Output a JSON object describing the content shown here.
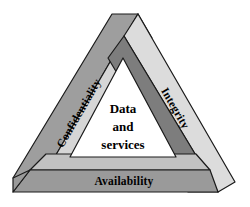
{
  "figure": {
    "name": "cia-triad-impossible-triangle",
    "background_color": "#ffffff",
    "outline_color": "#1a1a1a"
  },
  "beams": [
    {
      "id": "confidentiality",
      "label": "Confidentiality",
      "position": "left",
      "face_color": "#9e9e9e",
      "edge_color": "#d6d6d6",
      "label_rotation_deg": -62
    },
    {
      "id": "integrity",
      "label": "Integrity",
      "position": "right",
      "face_color": "#7d7d7d",
      "edge_color": "#dcdcdc",
      "label_rotation_deg": 62
    },
    {
      "id": "availability",
      "label": "Availability",
      "position": "bottom",
      "face_color": "#9a9a9a",
      "edge_color": "#c2c2c2",
      "label_rotation_deg": 0
    }
  ],
  "center": {
    "fill_color": "#ffffff",
    "lines": [
      "Data",
      "and",
      "services"
    ]
  }
}
